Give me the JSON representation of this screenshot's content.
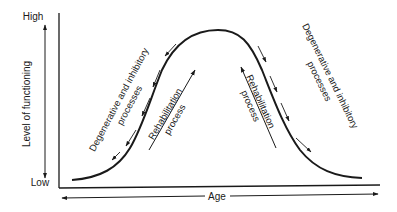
{
  "diagram": {
    "y_axis": {
      "label": "Level of functioning",
      "high_label": "High",
      "low_label": "Low"
    },
    "x_axis": {
      "label": "Age"
    },
    "curve": {
      "shape": "bell",
      "description": "Functioning rises with age to a peak then declines"
    },
    "annotations": {
      "left_degenerative": [
        "Degenerative and inhibitory",
        "processes"
      ],
      "left_rehab": [
        "Rehabilitation",
        "process"
      ],
      "right_rehab": [
        "Rehabilitation",
        "process"
      ],
      "right_degenerative": [
        "Degenerative and inhibitory",
        "processes"
      ]
    },
    "colors": {
      "ink": "#1a1a1a",
      "background": "#ffffff"
    }
  }
}
